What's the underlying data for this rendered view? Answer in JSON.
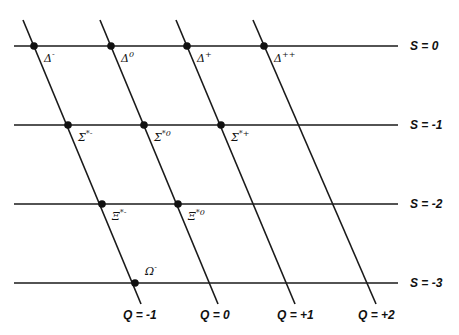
{
  "diagram": {
    "strangeness_lines": [
      {
        "label": "S = 0",
        "y": 46
      },
      {
        "label": "S = -1",
        "y": 125
      },
      {
        "label": "S = -2",
        "y": 204
      },
      {
        "label": "S = -3",
        "y": 283
      }
    ],
    "charge_lines": [
      {
        "label": "Q = -1",
        "x_top": 23,
        "x_bottom": 141
      },
      {
        "label": "Q = 0",
        "x_top": 100,
        "x_bottom": 218
      },
      {
        "label": "Q = +1",
        "x_top": 176,
        "x_bottom": 295
      },
      {
        "label": "Q = +2",
        "x_top": 253,
        "x_bottom": 376
      }
    ],
    "particles": [
      {
        "base": "Δ",
        "sup": "-",
        "x": 34,
        "y": 46
      },
      {
        "base": "Δ",
        "sup": "0",
        "x": 111,
        "y": 46
      },
      {
        "base": "Δ",
        "sup": "+",
        "x": 187,
        "y": 46
      },
      {
        "base": "Δ",
        "sup": "++",
        "x": 264,
        "y": 46
      },
      {
        "base": "Σ",
        "sup": "*-",
        "x": 68,
        "y": 125
      },
      {
        "base": "Σ",
        "sup": "*0",
        "x": 144,
        "y": 125
      },
      {
        "base": "Σ",
        "sup": "*+",
        "x": 221,
        "y": 125
      },
      {
        "base": "Ξ",
        "sup": "*-",
        "x": 102,
        "y": 204
      },
      {
        "base": "Ξ",
        "sup": "*0",
        "x": 178,
        "y": 204
      },
      {
        "base": "Ω",
        "sup": "-",
        "x": 135,
        "y": 283
      }
    ]
  }
}
